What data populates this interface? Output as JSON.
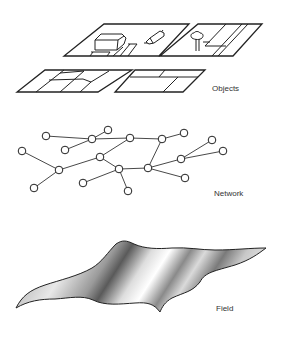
{
  "diagram": {
    "panels": [
      {
        "id": "objects",
        "label": "Objects"
      },
      {
        "id": "network",
        "label": "Network"
      },
      {
        "id": "field",
        "label": "Field"
      }
    ],
    "colors": {
      "stroke": "#222222",
      "background": "#ffffff",
      "label": "#333333"
    }
  }
}
